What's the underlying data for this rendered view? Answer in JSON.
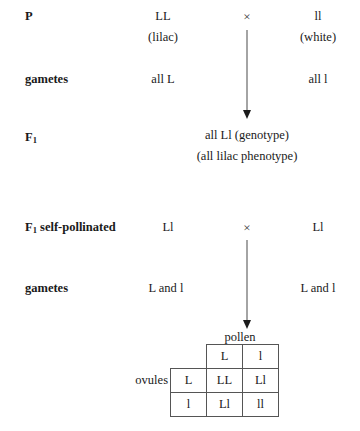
{
  "diagram": {
    "generations": [
      {
        "label": "P",
        "label_sub": "",
        "left": "LL",
        "left_note": "(lilac)",
        "cross_symbol": "×",
        "right": "ll",
        "right_note": "(white)"
      },
      {
        "label": "gametes",
        "label_sub": "",
        "left": "all L",
        "right": "all l"
      },
      {
        "label": "F",
        "label_sub": "1",
        "center_line1": "all Ll (genotype)",
        "center_line2": "(all lilac phenotype)"
      },
      {
        "label": "F",
        "label_sub": "1",
        "label_suffix": " self-pollinated",
        "left": "Ll",
        "cross_symbol": "×",
        "right": "Ll"
      },
      {
        "label": "gametes",
        "label_sub": "",
        "left": "L and l",
        "right": "L and l"
      }
    ],
    "punnett": {
      "column_axis_label": "pollen",
      "row_axis_label": "ovules",
      "column_headers": [
        "L",
        "l"
      ],
      "row_headers": [
        "L",
        "l"
      ],
      "cells": [
        [
          "LL",
          "Ll"
        ],
        [
          "Ll",
          "ll"
        ]
      ]
    }
  }
}
